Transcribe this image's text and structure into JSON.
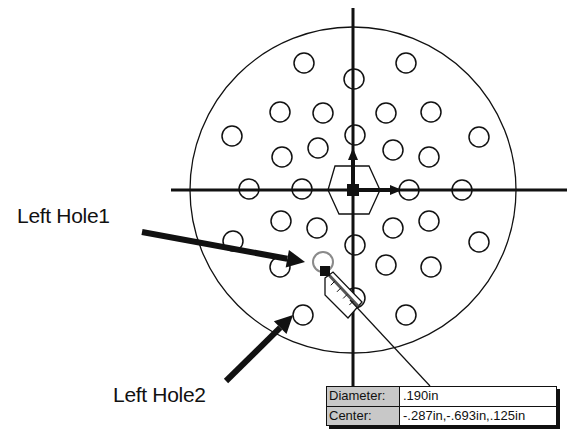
{
  "diagram": {
    "type": "cad-hole-pattern",
    "center": [
      353,
      190
    ],
    "outer_circle_radius": 163,
    "hole_radius": 10,
    "holes": [
      [
        304,
        63
      ],
      [
        406,
        63
      ],
      [
        354,
        79
      ],
      [
        280,
        112
      ],
      [
        323,
        113
      ],
      [
        386,
        113
      ],
      [
        431,
        112
      ],
      [
        232,
        136
      ],
      [
        355,
        135
      ],
      [
        479,
        137
      ],
      [
        318,
        148
      ],
      [
        393,
        150
      ],
      [
        282,
        157
      ],
      [
        429,
        157
      ],
      [
        249,
        189
      ],
      [
        302,
        189
      ],
      [
        409,
        190
      ],
      [
        462,
        190
      ],
      [
        281,
        221
      ],
      [
        317,
        228
      ],
      [
        393,
        228
      ],
      [
        429,
        221
      ],
      [
        233,
        241
      ],
      [
        355,
        245
      ],
      [
        479,
        242
      ],
      [
        280,
        267
      ],
      [
        386,
        265
      ],
      [
        431,
        267
      ],
      [
        355,
        298
      ],
      [
        303,
        315
      ],
      [
        406,
        315
      ]
    ],
    "selected_hole": [
      323,
      262
    ],
    "colors": {
      "line": "#111111",
      "selected": "#8a8a8a",
      "background": "#ffffff"
    }
  },
  "callouts": [
    {
      "id": "left-hole-1",
      "label": "Left Hole1",
      "target": [
        305,
        262
      ]
    },
    {
      "id": "left-hole-2",
      "label": "Left Hole2",
      "target": [
        293,
        315
      ]
    }
  ],
  "info_box": {
    "rows": [
      {
        "label": "Diameter:",
        "value": ".190in"
      },
      {
        "label": "Center:",
        "value": "-.287in,-.693in,.125in"
      }
    ]
  }
}
